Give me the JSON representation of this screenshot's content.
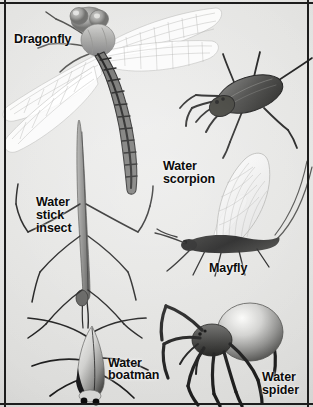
{
  "plate": {
    "kind": "natural-history-illustration-plate",
    "subject": "pond and freshwater insects and arachnids",
    "style": "black-and-white halftone photographic plate",
    "background_color": "#e3e3e1",
    "frame_color": "#1d1d1d",
    "label_text_color": "#0b0b0b",
    "width": 313,
    "height": 407
  },
  "labels": {
    "dragonfly": "Dragonfly",
    "water_scorpion": "Water\nscorpion",
    "water_stick_insect": "Water\nstick\ninsect",
    "mayfly": "Mayfly",
    "water_boatman": "Water\nboatman",
    "water_spider": "Water\nspider"
  },
  "specimens": [
    {
      "id": "dragonfly",
      "label": "Dragonfly",
      "position": "top-left, spanning upper half",
      "description": "large dragonfly with two pairs of pale translucent veined wings spread wide and a long dark banded segmented abdomen angled down-right"
    },
    {
      "id": "water-scorpion",
      "label": "Water scorpion",
      "position": "upper-right",
      "description": "dark oval flattened body with long slender legs, raptorial forelegs and a long tail breathing siphon"
    },
    {
      "id": "water-stick-insect",
      "label": "Water stick insect",
      "position": "center-left, vertical",
      "description": "extremely elongated pale stick-like body held vertically with very long thin splayed legs"
    },
    {
      "id": "mayfly",
      "label": "Mayfly",
      "position": "middle-right",
      "description": "dark stout body with large upright translucent veined triangular wings and long thin tail filaments"
    },
    {
      "id": "water-boatman",
      "label": "Water boatman",
      "position": "bottom-left",
      "description": "pointed boat-shaped pale body with two dark eye spots and long oar-like swimming legs"
    },
    {
      "id": "water-spider",
      "label": "Water spider",
      "position": "bottom-right",
      "description": "spider with a large pale globular abdomen and eight dark jointed legs"
    }
  ]
}
